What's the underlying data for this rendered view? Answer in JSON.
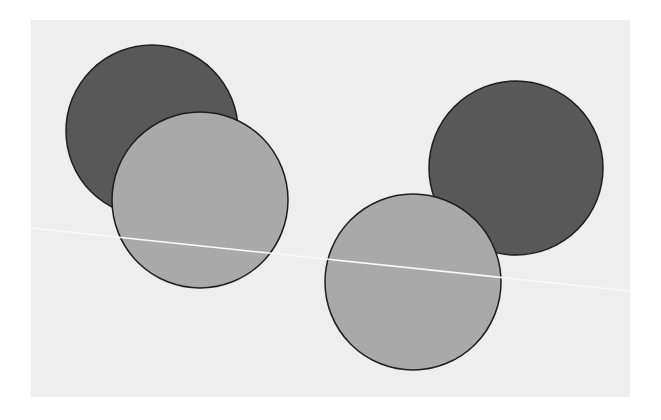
{
  "canvas": {
    "width": 661,
    "height": 420,
    "background": "#ffffff"
  },
  "panel": {
    "x": 31,
    "y": 20,
    "width": 599,
    "height": 377,
    "fill": "#eeeeee"
  },
  "line": {
    "x1": 31,
    "y1": 228,
    "x2": 630,
    "y2": 291,
    "stroke": "#fafafa",
    "width": 1.5
  },
  "colors": {
    "dark": "#585858",
    "light": "#a9a9a9",
    "outline": "#1e1e1e"
  },
  "circles": [
    {
      "id": "dark-left",
      "cx": 152,
      "cy": 131,
      "r": 86,
      "shade": "dark"
    },
    {
      "id": "light-left",
      "cx": 200,
      "cy": 200,
      "r": 88,
      "shade": "light"
    },
    {
      "id": "dark-right",
      "cx": 516,
      "cy": 168,
      "r": 87,
      "shade": "dark"
    },
    {
      "id": "light-right",
      "cx": 413,
      "cy": 282,
      "r": 88,
      "shade": "light"
    }
  ]
}
